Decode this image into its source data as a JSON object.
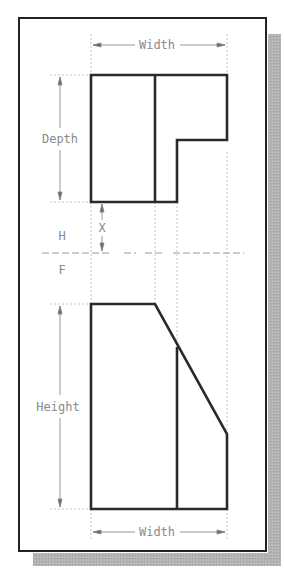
{
  "figure": {
    "type": "orthographic-projection",
    "views": [
      "top (H)",
      "front (F)"
    ],
    "labels": {
      "top_width": "Width",
      "depth": "Depth",
      "plane_h": "H",
      "plane_f": "F",
      "gap": "X",
      "height": "Height",
      "bottom_width": "Width"
    },
    "colors": {
      "object_line": "#2a2a2a",
      "dim_line": "#8a8a8a",
      "projection_line": "#b0b0b0",
      "frame": "#222222",
      "shadow": "#a8a8a8",
      "background": "#ffffff"
    }
  }
}
